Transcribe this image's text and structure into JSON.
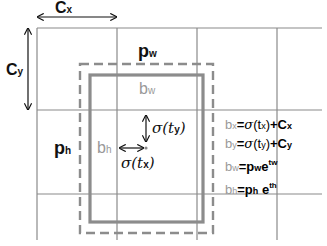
{
  "diagram": {
    "type": "bounding-box-prediction",
    "colors": {
      "grid": "#8a8a8a",
      "anchor_box_dashed": "#8c8c8c",
      "predicted_box": "#8c8c8c",
      "text_dark": "#111111",
      "text_gray": "#999999"
    },
    "labels": {
      "cx": {
        "base": "C",
        "sub": "x"
      },
      "cy": {
        "base": "C",
        "sub": "y"
      },
      "pw": {
        "base": "p",
        "sub": "w"
      },
      "ph": {
        "base": "p",
        "sub": "h"
      },
      "bw": {
        "base": "b",
        "sub": "w"
      },
      "bh": {
        "base": "b",
        "sub": "h"
      },
      "sigma_ty": "σ(t",
      "sigma_ty_sub": "y",
      "sigma_tx": "σ(t",
      "sigma_tx_sub": "x",
      "close_paren": ")"
    },
    "equations": [
      {
        "lhs": "b",
        "lhs_sub": "x",
        "eq": "=",
        "sigma": "σ",
        "arg": "(t",
        "arg_sub": "x",
        "close": ")",
        "plus": "+C",
        "plus_sub": "x"
      },
      {
        "lhs": "b",
        "lhs_sub": "y",
        "eq": "=",
        "sigma": "σ",
        "arg": "(t",
        "arg_sub": "y",
        "close": ")",
        "plus": "+C",
        "plus_sub": "y"
      },
      {
        "lhs": "b",
        "lhs_sub": "w",
        "eq": "=",
        "p": "p",
        "p_sub": "w",
        "e": "e",
        "exp": "tw"
      },
      {
        "lhs": "b",
        "lhs_sub": "h",
        "eq": "=",
        "p": "p",
        "p_sub": "h",
        "e": "e",
        "exp": "th"
      }
    ]
  }
}
